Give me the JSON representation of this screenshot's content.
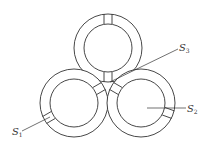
{
  "diagram": {
    "stroke_color": "#333333",
    "background": "#ffffff",
    "rings": [
      {
        "id": "top",
        "cx": 108,
        "cy": 48,
        "r_outer": 34,
        "r_inner": 24,
        "gap_angles_deg": [
          270,
          90
        ]
      },
      {
        "id": "bottom-left",
        "cx": 74,
        "cy": 103,
        "r_outer": 34,
        "r_inner": 24,
        "gap_angles_deg": [
          -30,
          150
        ]
      },
      {
        "id": "bottom-right",
        "cx": 141,
        "cy": 103,
        "r_outer": 34,
        "r_inner": 24,
        "gap_angles_deg": [
          210,
          20
        ]
      }
    ],
    "labels": [
      {
        "id": "s3",
        "base": "S",
        "sub": "3",
        "x": 179,
        "y": 43
      },
      {
        "id": "s2",
        "base": "S",
        "sub": "2",
        "x": 187,
        "y": 104
      },
      {
        "id": "s1",
        "base": "S",
        "sub": "1",
        "x": 12,
        "y": 127
      }
    ],
    "leaders": [
      {
        "id": "s3-leader",
        "x1": 110,
        "y1": 82,
        "x2": 178,
        "y2": 49
      },
      {
        "id": "s2-leader",
        "x1": 147,
        "y1": 108,
        "x2": 186,
        "y2": 108
      },
      {
        "id": "s1-leader",
        "x1": 22,
        "y1": 131,
        "x2": 50,
        "y2": 117
      }
    ]
  }
}
